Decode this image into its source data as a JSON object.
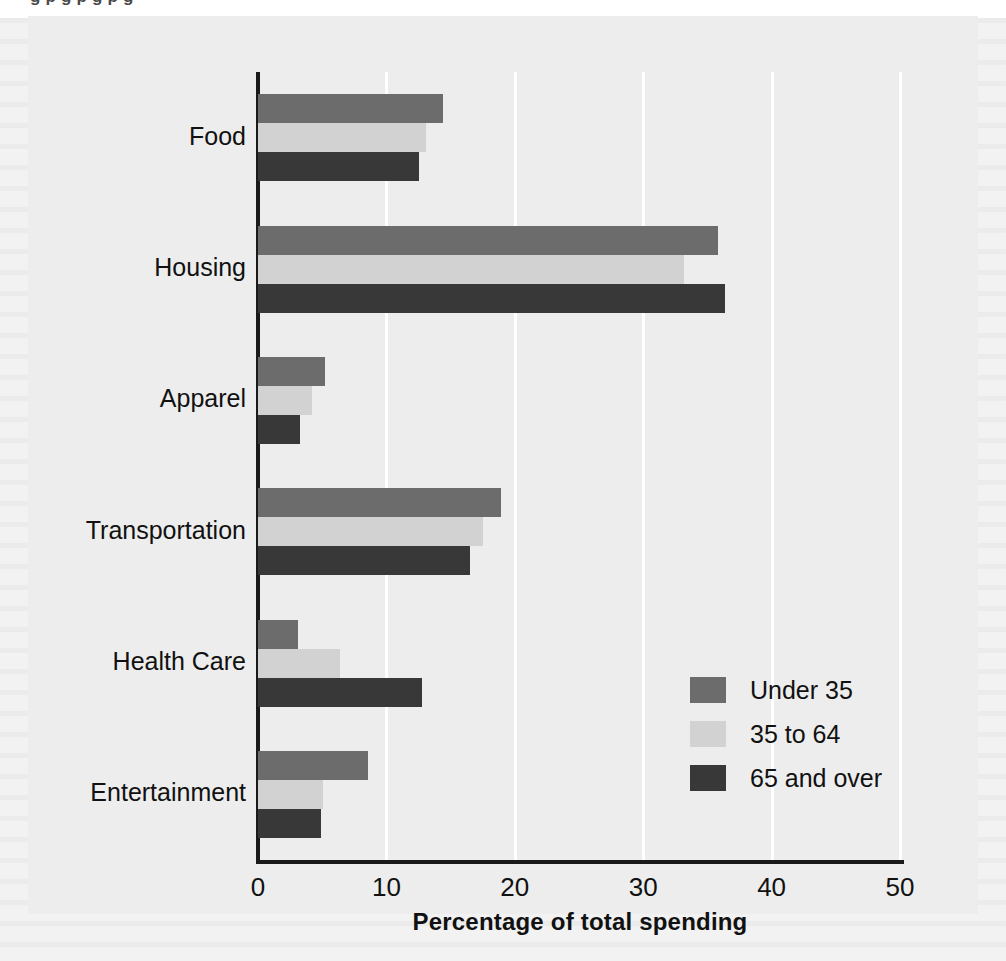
{
  "page": {
    "cut_off_top_line": "g   p g   p g p    g",
    "background_color": "#f2f2f2",
    "plot_background_color": "#ededed",
    "gridline_color": "#ffffff",
    "axis_color": "#1a1a1a"
  },
  "chart_data": {
    "type": "bar",
    "orientation": "horizontal",
    "title": "",
    "xlabel": "Percentage of total spending",
    "ylabel": "",
    "xlim": [
      0,
      50
    ],
    "xticks": [
      0,
      10,
      20,
      30,
      40,
      50
    ],
    "xtick_labels": [
      "0",
      "10",
      "20",
      "30",
      "40",
      "50"
    ],
    "grid": true,
    "grid_axis": "x",
    "legend_position": "lower right",
    "categories": [
      "Food",
      "Housing",
      "Apparel",
      "Transportation",
      "Health Care",
      "Entertainment"
    ],
    "series": [
      {
        "name": "Under 35",
        "color": "#6c6c6c",
        "values": [
          14.4,
          35.8,
          5.2,
          18.9,
          3.1,
          8.6
        ]
      },
      {
        "name": "35 to 64",
        "color": "#d2d2d2",
        "values": [
          13.1,
          33.2,
          4.2,
          17.5,
          6.4,
          5.1
        ]
      },
      {
        "name": "65 and over",
        "color": "#383838",
        "values": [
          12.5,
          36.4,
          3.3,
          16.5,
          12.8,
          4.9
        ]
      }
    ]
  }
}
